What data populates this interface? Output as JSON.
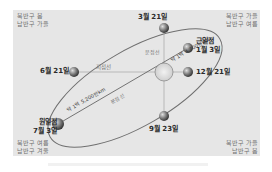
{
  "diagram": {
    "corners": {
      "top_left": [
        "북반구 봄",
        "남반구 가을"
      ],
      "top_right": [
        "북반구 가을",
        "남반구 여름"
      ],
      "bottom_left": [
        "북반구 여름",
        "남반구 겨울"
      ],
      "bottom_right": [
        "북반구 가을",
        "남반구 봄"
      ]
    },
    "positions": {
      "march": "3월 21일",
      "june": "6월 21일",
      "september": "9월 23일",
      "december": "12월 21일",
      "perihelion_name": "근일점",
      "perihelion_date": "1월 3일",
      "aphelion_name": "원일점",
      "aphelion_date": "7월 3일"
    },
    "lines": {
      "solstice_line": "지점선",
      "equinox_line": "분점선",
      "perihelion_distance": "약 1억 4,700만km",
      "aphelion_distance": "약 1억 5,200만km"
    },
    "colors": {
      "panel": "#e6e6e6",
      "orbit": "#6f6f6f",
      "sun": "#dcdcdc",
      "earth": "#555555"
    }
  }
}
